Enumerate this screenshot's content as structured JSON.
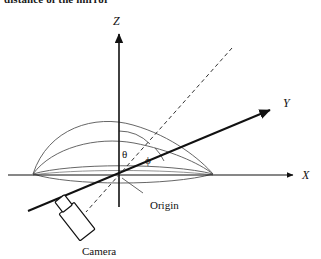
{
  "figure": {
    "caption": "distance of the mirror",
    "background_color": "#ffffff",
    "line_color": "#111111",
    "thin_line_color": "#555555",
    "width": 321,
    "height": 259
  },
  "axes": {
    "origin": {
      "x": 119,
      "y": 175,
      "label": "Origin"
    },
    "z": {
      "label": "Z",
      "label_x": 115,
      "label_y": 23,
      "from_x": 119,
      "from_y": 207,
      "to_x": 119,
      "to_y": 32
    },
    "x": {
      "label": "X",
      "label_x": 303,
      "label_y": 177,
      "from_x": 8,
      "from_y": 175,
      "to_x": 295,
      "to_y": 175
    },
    "y": {
      "label": "Y",
      "label_x": 284,
      "label_y": 107,
      "from_x": 28,
      "from_y": 211,
      "to_x": 272,
      "to_y": 109
    }
  },
  "angles": {
    "theta": {
      "symbol": "θ",
      "label_x": 123,
      "label_y": 157,
      "description": "angle between Z axis and dashed ray"
    },
    "phi": {
      "symbol": "ϕ",
      "label_x": 147,
      "label_y": 163,
      "description": "angle between dashed ray and Y axis"
    }
  },
  "ray": {
    "name": "dashed-ray",
    "style": "dashed",
    "from_x": 232,
    "from_y": 48,
    "to_x": 86,
    "to_y": 212
  },
  "dome": {
    "name": "hemisphere-dome",
    "left_x": 33,
    "right_x": 213,
    "base_y": 175,
    "outer_apex_y": 129,
    "inner_apex_y": 145,
    "ellipse_rx": 90,
    "ellipse_ry": 9
  },
  "camera": {
    "label": "Camera",
    "label_x": 82,
    "label_y": 254,
    "body_cx": 74,
    "body_cy": 223,
    "body_w": 17,
    "body_h": 32,
    "lens_cx": 92,
    "lens_cy": 208,
    "lens_w": 12,
    "lens_h": 12,
    "rotation_deg": -38
  },
  "origin_leader": {
    "name": "origin-leader-line",
    "from_x": 142,
    "from_y": 192,
    "to_x": 122,
    "to_y": 178
  },
  "origin_label": {
    "text": "Origin",
    "x": 150,
    "y": 209
  }
}
